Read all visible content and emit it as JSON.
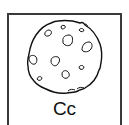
{
  "card": {
    "letter": "Cc",
    "picture": "cookie",
    "colors": {
      "border": "#3a3a3a",
      "ink": "#111111",
      "background": "#ffffff"
    }
  }
}
